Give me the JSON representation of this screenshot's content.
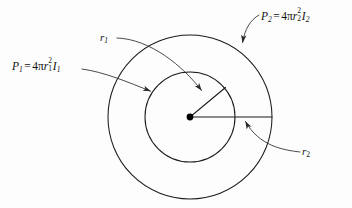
{
  "figure": {
    "background_color": "#fdfdfd",
    "ink_color": "#1b1b1b",
    "center_point": {
      "x": 190,
      "y": 117,
      "dot_radius": 3.4
    },
    "circles": [
      {
        "name": "inner-circle",
        "cx": 190,
        "cy": 117,
        "r": 45
      },
      {
        "name": "outer-circle",
        "cx": 190,
        "cy": 117,
        "r": 82
      }
    ],
    "radius_lines": [
      {
        "name": "inner-radius-line",
        "from": [
          190,
          117
        ],
        "to": [
          225,
          88
        ]
      },
      {
        "name": "outer-radius-line",
        "from": [
          190,
          117
        ],
        "to": [
          272,
          117
        ]
      }
    ]
  },
  "labels": {
    "p1": {
      "name": "power-inner-label",
      "symbol": "P",
      "symbol_subscript": "1",
      "equals": "=",
      "coefficient": "4",
      "pi": "π",
      "radius_symbol": "r",
      "radius_subscript": "1",
      "radius_exponent": "2",
      "intensity_symbol": "I",
      "intensity_subscript": "1",
      "plain_text": "P1 = 4πr1²I1"
    },
    "p2": {
      "name": "power-outer-label",
      "symbol": "P",
      "symbol_subscript": "2",
      "equals": "=",
      "coefficient": "4",
      "pi": "π",
      "radius_symbol": "r",
      "radius_subscript": "2",
      "radius_exponent": "2",
      "intensity_symbol": "I",
      "intensity_subscript": "2",
      "plain_text": "P2 = 4πr2²I2"
    },
    "r1": {
      "name": "inner-radius-label",
      "symbol": "r",
      "subscript": "1",
      "plain_text": "r1"
    },
    "r2": {
      "name": "outer-radius-label",
      "symbol": "r",
      "subscript": "2",
      "plain_text": "r2"
    }
  },
  "leaders": [
    {
      "name": "p1-leader",
      "from_label": "p1",
      "points_to": "inner-circle"
    },
    {
      "name": "p2-leader",
      "from_label": "p2",
      "points_to": "outer-circle"
    },
    {
      "name": "r1-leader",
      "from_label": "r1",
      "points_to": "inner-radius-line"
    },
    {
      "name": "r2-leader",
      "from_label": "r2",
      "points_to": "outer-radius-line"
    }
  ]
}
